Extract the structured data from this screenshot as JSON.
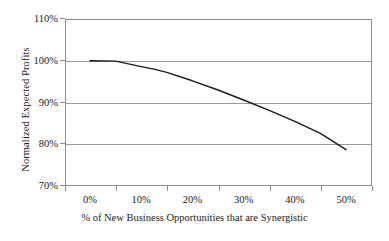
{
  "chart_data": {
    "type": "line",
    "title": "",
    "xlabel": "% of New Business Opportunities that are Synergistic",
    "ylabel": "Normalized Expected Profits",
    "xlim": [
      0,
      50
    ],
    "ylim": [
      70,
      110
    ],
    "xtick_labels": [
      "0%",
      "10%",
      "20%",
      "30%",
      "40%",
      "50%"
    ],
    "xtick_values": [
      0,
      10,
      20,
      30,
      40,
      50
    ],
    "ytick_labels": [
      "70%",
      "80%",
      "90%",
      "100%",
      "110%"
    ],
    "ytick_values": [
      70,
      80,
      90,
      100,
      110
    ],
    "grid": "horizontal",
    "legend": "none",
    "series": [
      {
        "name": "Normalized Expected Profits",
        "color": "#1a1a1a",
        "x": [
          0,
          5,
          10,
          12.5,
          15,
          20,
          25,
          30,
          35,
          40,
          45,
          50
        ],
        "values": [
          100,
          99.9,
          98.6,
          98.0,
          97.2,
          95.2,
          93.0,
          90.6,
          88.1,
          85.5,
          82.6,
          78.7
        ]
      }
    ]
  },
  "axes": {
    "y_title": "Normalized Expected Profits",
    "x_title": "% of New Business Opportunities that are Synergistic"
  },
  "colors": {
    "line": "#1a1a1a",
    "grid": "#9a9a9a",
    "frame": "#8c8c8c",
    "background": "#ffffff",
    "text": "#1a1a1a"
  }
}
